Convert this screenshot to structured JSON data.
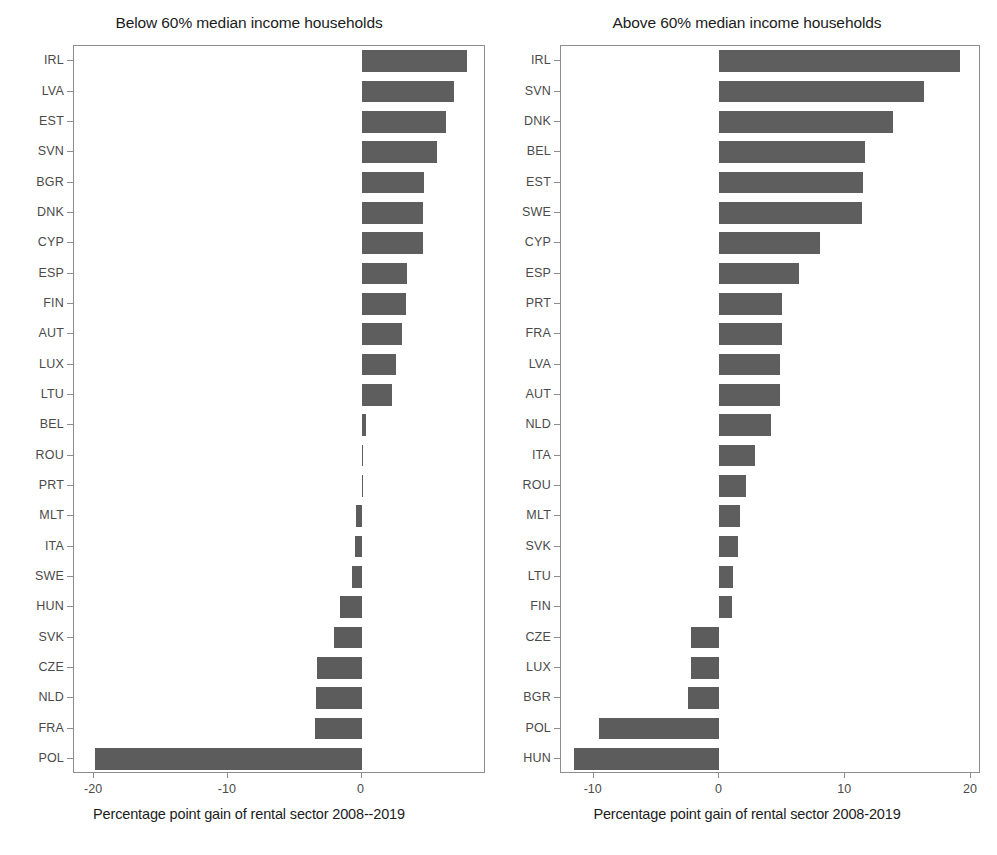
{
  "figure": {
    "width": 997,
    "height": 855,
    "bar_color": "#5e5e5e",
    "axis_color": "#8d8d8d",
    "tick_label_color": "#4a4a4a"
  },
  "chart_data": [
    {
      "type": "bar",
      "orientation": "horizontal",
      "panel_index": 0,
      "title": "Below 60% median income households",
      "xlabel": "Percentage point gain of rental sector 2008--2019",
      "ylabel": "",
      "xlim": [
        -21.5,
        9.3
      ],
      "xticks": [
        -20,
        -10,
        0
      ],
      "xticklabels": [
        "-20",
        "-10",
        "0"
      ],
      "grid": false,
      "legend": false,
      "categories": [
        "IRL",
        "LVA",
        "EST",
        "SVN",
        "BGR",
        "DNK",
        "CYP",
        "ESP",
        "FIN",
        "AUT",
        "LUX",
        "LTU",
        "BEL",
        "ROU",
        "PRT",
        "MLT",
        "ITA",
        "SWE",
        "HUN",
        "SVK",
        "CZE",
        "NLD",
        "FRA",
        "POL"
      ],
      "values": [
        7.9,
        6.9,
        6.3,
        5.6,
        4.7,
        4.6,
        4.6,
        3.4,
        3.3,
        3.0,
        2.6,
        2.3,
        0.3,
        0.05,
        0.0,
        -0.4,
        -0.5,
        -0.7,
        -1.6,
        -2.1,
        -3.3,
        -3.4,
        -3.5,
        -19.9
      ]
    },
    {
      "type": "bar",
      "orientation": "horizontal",
      "panel_index": 1,
      "title": "Above 60% median income households",
      "xlabel": "Percentage point gain of rental sector 2008-2019",
      "ylabel": "",
      "xlim": [
        -12.6,
        20.8
      ],
      "xticks": [
        -10,
        0,
        10,
        20
      ],
      "xticklabels": [
        "-10",
        "0",
        "10",
        "20"
      ],
      "grid": false,
      "legend": false,
      "categories": [
        "IRL",
        "SVN",
        "DNK",
        "BEL",
        "EST",
        "SWE",
        "CYP",
        "ESP",
        "PRT",
        "FRA",
        "LVA",
        "AUT",
        "NLD",
        "ITA",
        "ROU",
        "MLT",
        "SVK",
        "LTU",
        "FIN",
        "CZE",
        "LUX",
        "BGR",
        "POL",
        "HUN"
      ],
      "values": [
        19.1,
        16.3,
        13.8,
        11.6,
        11.4,
        11.3,
        8.0,
        6.3,
        5.0,
        5.0,
        4.8,
        4.8,
        4.1,
        2.8,
        2.1,
        1.6,
        1.5,
        1.1,
        1.0,
        -2.3,
        -2.3,
        -2.5,
        -9.6,
        -11.6
      ]
    }
  ]
}
